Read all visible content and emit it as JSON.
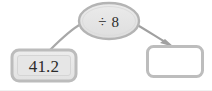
{
  "diagram": {
    "type": "function-machine",
    "background_color": "#ffffff",
    "input_node": {
      "name": "input-box",
      "shape": "rounded-rectangle",
      "value": "41.2",
      "fill_color": "#e8e8e8",
      "border_color": "#b6b6b6",
      "x": 12,
      "y": 50,
      "width": 64,
      "height": 31
    },
    "operation_node": {
      "name": "operation-oval",
      "shape": "ellipse",
      "label": "÷ 8",
      "operator_symbol": "÷",
      "operand": "8",
      "fill_color": "#e4e4e4",
      "border_color": "#b0b0b0",
      "cx": 109,
      "cy": 21,
      "rx": 30,
      "ry": 18
    },
    "output_node": {
      "name": "output-box",
      "shape": "rounded-rectangle",
      "value": "",
      "placeholder": "",
      "fill_color": "#ffffff",
      "border_color": "#b6b6b6",
      "x": 146,
      "y": 45,
      "width": 58,
      "height": 33
    },
    "connectors": [
      {
        "name": "input-to-operation-connector",
        "from": "input-box",
        "to": "operation-oval",
        "arrowhead": false,
        "color": "#a8a8a8"
      },
      {
        "name": "operation-to-output-connector",
        "from": "operation-oval",
        "to": "output-box",
        "arrowhead": true,
        "color": "#a0a0a0"
      }
    ]
  }
}
